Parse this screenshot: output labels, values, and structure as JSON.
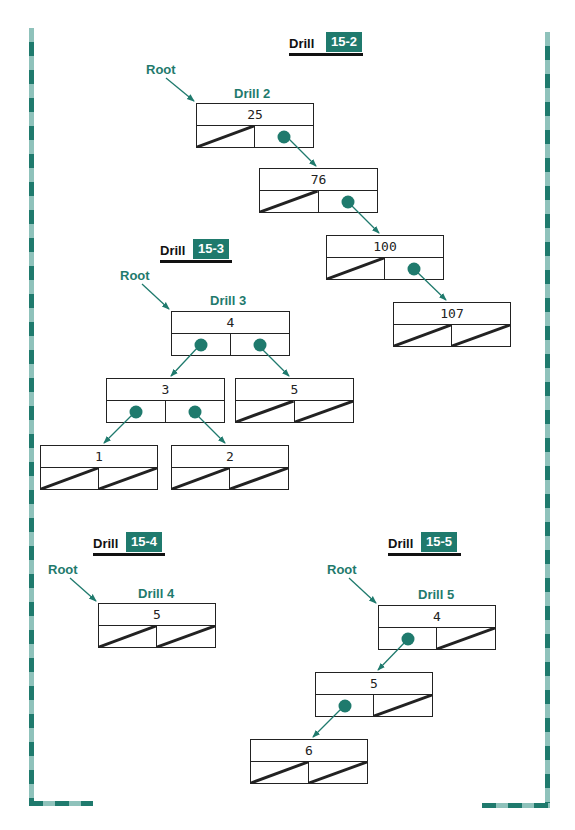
{
  "colors": {
    "accent": "#1f7a6d",
    "accent_light": "#8fc2bb",
    "line": "#222222"
  },
  "drills": [
    {
      "heading": {
        "word": "Drill",
        "number": "15-2"
      },
      "root_label": "Root",
      "tree_title": "Drill 2",
      "nodes": [
        {
          "value": "25",
          "left": "null",
          "right": "pointer"
        },
        {
          "value": "76",
          "left": "null",
          "right": "pointer"
        },
        {
          "value": "100",
          "left": "null",
          "right": "pointer"
        },
        {
          "value": "107",
          "left": "null",
          "right": "null"
        }
      ]
    },
    {
      "heading": {
        "word": "Drill",
        "number": "15-3"
      },
      "root_label": "Root",
      "tree_title": "Drill 3",
      "nodes": [
        {
          "value": "4",
          "left": "pointer",
          "right": "pointer"
        },
        {
          "value": "3",
          "left": "pointer",
          "right": "pointer"
        },
        {
          "value": "5",
          "left": "null",
          "right": "null"
        },
        {
          "value": "1",
          "left": "null",
          "right": "null"
        },
        {
          "value": "2",
          "left": "null",
          "right": "null"
        }
      ]
    },
    {
      "heading": {
        "word": "Drill",
        "number": "15-4"
      },
      "root_label": "Root",
      "tree_title": "Drill 4",
      "nodes": [
        {
          "value": "5",
          "left": "null",
          "right": "null"
        }
      ]
    },
    {
      "heading": {
        "word": "Drill",
        "number": "15-5"
      },
      "root_label": "Root",
      "tree_title": "Drill 5",
      "nodes": [
        {
          "value": "4",
          "left": "pointer",
          "right": "null"
        },
        {
          "value": "5",
          "left": "pointer",
          "right": "null"
        },
        {
          "value": "6",
          "left": "null",
          "right": "null"
        }
      ]
    }
  ]
}
